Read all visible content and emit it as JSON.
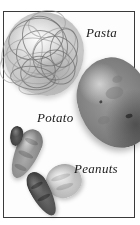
{
  "figure": {
    "kind": "grayscale-photograph-plate",
    "background_color": "#ffffff",
    "border_color": "#3a3a3a",
    "label_color": "#1a1a1a"
  },
  "labels": {
    "pasta": "Pasta",
    "potato": "Potato",
    "peanuts": "Peanuts"
  },
  "objects": [
    {
      "name": "pasta",
      "description": "tangled nest of pale noodles",
      "tone": "#c8c8c8"
    },
    {
      "name": "potato",
      "description": "large oval potato",
      "tone": "#7e7e7e"
    },
    {
      "name": "peanuts",
      "description": "peanut shells and a single kernel",
      "tone": "#8b8b8b"
    }
  ]
}
